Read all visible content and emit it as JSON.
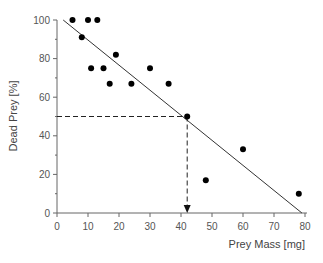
{
  "chart_data": {
    "type": "scatter",
    "title": "",
    "xlabel": "Prey Mass [mg]",
    "ylabel": "Dead Prey  [%]",
    "xlim": [
      0,
      80
    ],
    "ylim": [
      0,
      100
    ],
    "x_ticks": [
      0,
      10,
      20,
      30,
      40,
      50,
      60,
      70,
      80
    ],
    "y_ticks": [
      0,
      20,
      40,
      60,
      80,
      100
    ],
    "grid": false,
    "legend": null,
    "series": [
      {
        "name": "observations",
        "points": [
          {
            "x": 5,
            "y": 100
          },
          {
            "x": 8,
            "y": 91
          },
          {
            "x": 10,
            "y": 100
          },
          {
            "x": 13,
            "y": 100
          },
          {
            "x": 11,
            "y": 75
          },
          {
            "x": 15,
            "y": 75
          },
          {
            "x": 17,
            "y": 67
          },
          {
            "x": 19,
            "y": 82
          },
          {
            "x": 24,
            "y": 67
          },
          {
            "x": 30,
            "y": 75
          },
          {
            "x": 36,
            "y": 67
          },
          {
            "x": 42,
            "y": 50
          },
          {
            "x": 48,
            "y": 17
          },
          {
            "x": 60,
            "y": 33
          },
          {
            "x": 78,
            "y": 10
          }
        ]
      }
    ],
    "regression_line": {
      "x1": 2,
      "y1": 100,
      "x2": 79,
      "y2": 0
    },
    "annotations": [
      {
        "type": "dashed-horizontal",
        "y": 50,
        "x_from": 0,
        "x_to": 42
      },
      {
        "type": "dashed-vertical-arrow",
        "x": 42,
        "y_from": 50,
        "y_to": 0
      }
    ]
  },
  "layout": {
    "plot_left": 57,
    "plot_right": 305,
    "plot_top": 20,
    "plot_bottom": 213,
    "colors": {
      "axis": "#666666",
      "text": "#555555",
      "points": "#000000",
      "line": "#333333"
    }
  }
}
